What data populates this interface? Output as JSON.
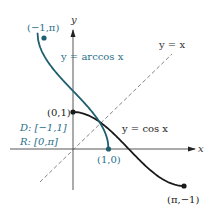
{
  "chart_data": {
    "type": "line",
    "title": "",
    "xlabel": "x",
    "ylabel": "y",
    "grid": false,
    "series": [
      {
        "name": "y = arccos x",
        "domain": [
          -1,
          1
        ],
        "x": [
          -1,
          -0.5,
          0,
          0.5,
          1
        ],
        "values": [
          3.1416,
          2.0944,
          1.5708,
          1.0472,
          0
        ],
        "color": "#1f5f6f",
        "style": "solid"
      },
      {
        "name": "y = cos x",
        "domain": [
          0,
          3.1416
        ],
        "x": [
          0,
          0.7854,
          1.5708,
          2.3562,
          3.1416
        ],
        "values": [
          1,
          0.7071,
          0,
          -0.7071,
          -1
        ],
        "color": "#1a1a1a",
        "style": "solid"
      },
      {
        "name": "y = x",
        "x": [
          -0.95,
          2.7
        ],
        "values": [
          -0.9,
          2.5
        ],
        "color": "#555555",
        "style": "dashed"
      }
    ],
    "annotations": [
      {
        "text": "(−1,π)",
        "point": [
          -1,
          3.1416
        ]
      },
      {
        "text": "(0,1)",
        "point": [
          0,
          1
        ]
      },
      {
        "text": "(1,0)",
        "point": [
          1,
          0
        ]
      },
      {
        "text": "(π,−1)",
        "point": [
          3.1416,
          -1
        ]
      },
      {
        "text": "D: [−1,1]"
      },
      {
        "text": "R: [0,π]"
      }
    ]
  },
  "labels": {
    "y_axis": "y",
    "x_axis": "x",
    "arccos_label": "y = arccos x",
    "cos_label": "y = cos x",
    "identity_label": "y = x",
    "pt_neg1_pi": "(−1,π)",
    "pt_0_1": "(0,1)",
    "pt_1_0": "(1,0)",
    "pt_pi_neg1": "(π,−1)",
    "domain": "D: [−1,1]",
    "range": "R: [0,π]"
  },
  "colors": {
    "arccos": "#1f5f6f",
    "cos": "#1a1a1a",
    "teal_text": "#2a6f8a",
    "axis": "#444444",
    "identity": "#666666"
  }
}
